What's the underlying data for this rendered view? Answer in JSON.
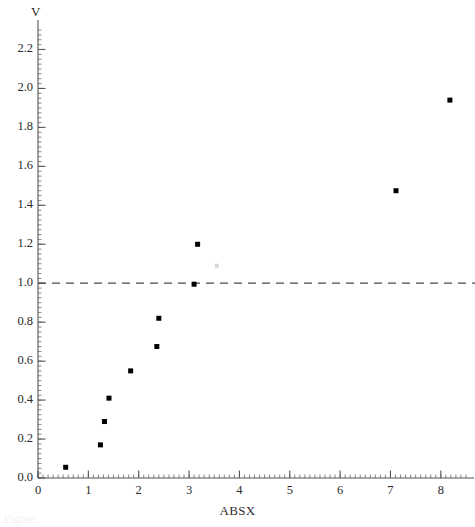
{
  "chart_data": {
    "type": "scatter",
    "title": "",
    "xlabel": "ABSX",
    "ylabel": "V",
    "xlim": [
      0,
      8.5
    ],
    "ylim": [
      0.0,
      2.3
    ],
    "grid": false,
    "legend": null,
    "x_ticks": [
      0,
      1,
      2,
      3,
      4,
      5,
      6,
      7,
      8
    ],
    "x_tick_labels": [
      "0",
      "1",
      "2",
      "3",
      "4",
      "5",
      "6",
      "7",
      "8"
    ],
    "x_minor_tick_step": 0.1,
    "y_ticks": [
      0.0,
      0.2,
      0.4,
      0.6,
      0.8,
      1.0,
      1.2,
      1.4,
      1.6,
      1.8,
      2.0,
      2.2
    ],
    "y_tick_labels": [
      "0.0",
      "0.2",
      "0.4",
      "0.6",
      "0.8",
      "1.0",
      "1.2",
      "1.4",
      "1.6",
      "1.8",
      "2.0",
      "2.2"
    ],
    "y_minor_tick_step": 0.025,
    "marker": "square",
    "marker_color": "#000000",
    "marker_size_px": 5,
    "points": [
      {
        "x": 0.55,
        "y": 0.055
      },
      {
        "x": 1.24,
        "y": 0.17
      },
      {
        "x": 1.32,
        "y": 0.29
      },
      {
        "x": 1.41,
        "y": 0.41
      },
      {
        "x": 1.84,
        "y": 0.55
      },
      {
        "x": 2.36,
        "y": 0.675
      },
      {
        "x": 2.4,
        "y": 0.82
      },
      {
        "x": 3.1,
        "y": 0.995
      },
      {
        "x": 3.17,
        "y": 1.2
      },
      {
        "x": 7.11,
        "y": 1.475
      },
      {
        "x": 8.18,
        "y": 1.94
      }
    ],
    "reference_line": {
      "orientation": "horizontal",
      "value": 1.0,
      "style": "dashed",
      "color": "#4a4a4a"
    },
    "faint_marker": {
      "x": 3.55,
      "y": 1.09,
      "color": "#d8d8d8"
    },
    "axis_color": "#555555",
    "background": "#ffffff"
  },
  "caption": {
    "fragment": "Figure"
  }
}
